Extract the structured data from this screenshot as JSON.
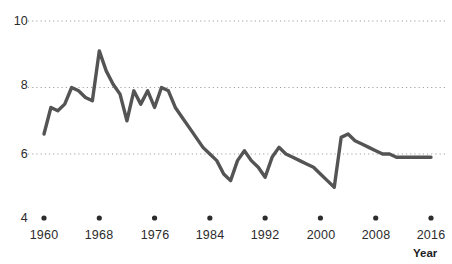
{
  "chart_data": {
    "type": "line",
    "title": "",
    "subtitle": "",
    "xlabel": "Year",
    "ylabel": "",
    "xlim": [
      1959,
      2017
    ],
    "ylim": [
      4,
      10
    ],
    "grid": "horizontal-dotted",
    "legend": "none",
    "line_color": "#545454",
    "grid_color": "#9a9a9a",
    "text_color": "#2c2c2c",
    "x_ticks": [
      1960,
      1968,
      1976,
      1984,
      1992,
      2000,
      2008,
      2016
    ],
    "x_tick_labels": [
      "1960",
      "1968",
      "1976",
      "1984",
      "1992",
      "2000",
      "2008",
      "2016"
    ],
    "y_ticks": [
      4,
      6,
      8,
      10
    ],
    "y_tick_labels": [
      "4",
      "6",
      "8",
      "10"
    ],
    "gridline_values": [
      6,
      8,
      10
    ],
    "series": [
      {
        "name": "value",
        "x": [
          1960,
          1961,
          1962,
          1963,
          1964,
          1965,
          1966,
          1967,
          1968,
          1969,
          1970,
          1971,
          1972,
          1973,
          1974,
          1975,
          1976,
          1977,
          1978,
          1979,
          1980,
          1981,
          1982,
          1983,
          1984,
          1985,
          1986,
          1987,
          1988,
          1989,
          1990,
          1991,
          1992,
          1993,
          1994,
          1995,
          1996,
          1997,
          1998,
          1999,
          2000,
          2001,
          2002,
          2003,
          2004,
          2005,
          2006,
          2007,
          2008,
          2009,
          2010,
          2011,
          2012,
          2013,
          2014,
          2015,
          2016
        ],
        "values": [
          6.6,
          7.4,
          7.3,
          7.5,
          8.0,
          7.9,
          7.7,
          7.6,
          9.1,
          8.5,
          8.1,
          7.8,
          7.0,
          7.9,
          7.5,
          7.9,
          7.4,
          8.0,
          7.9,
          7.4,
          7.1,
          6.8,
          6.5,
          6.2,
          6.0,
          5.8,
          5.4,
          5.2,
          5.8,
          6.1,
          5.8,
          5.6,
          5.3,
          5.9,
          6.2,
          6.0,
          5.9,
          5.8,
          5.7,
          5.6,
          5.4,
          5.2,
          5.0,
          6.5,
          6.6,
          6.4,
          6.3,
          6.2,
          6.1,
          6.0,
          6.0,
          5.9,
          5.9,
          5.9,
          5.9,
          5.9,
          5.9
        ]
      }
    ]
  },
  "axes": {
    "y_labels": [
      "10",
      "8",
      "6",
      "4"
    ],
    "x_labels": [
      "1960",
      "1968",
      "1976",
      "1984",
      "1992",
      "2000",
      "2008",
      "2016"
    ],
    "x_axis_title": "Year"
  }
}
